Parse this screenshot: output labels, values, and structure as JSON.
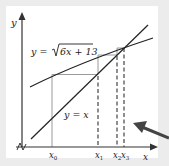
{
  "diagram": {
    "axes": {
      "x_label": "x",
      "y_label": "y"
    },
    "curves": {
      "curve_label": "y = √(6x + 13)",
      "curve_prefix": "y = ",
      "curve_radicand": "6x + 13",
      "line_label": "y = x"
    },
    "x_ticks": [
      {
        "base": "x",
        "sub": "0"
      },
      {
        "base": "x",
        "sub": "1"
      },
      {
        "base": "x",
        "sub": "2"
      },
      {
        "base": "x",
        "sub": "3"
      }
    ],
    "colors": {
      "axis": "#333333",
      "curve": "#222222",
      "cobweb": "#9a9a9a",
      "dashed": "#333333",
      "arrow": "#444444",
      "background": "#ececec",
      "panel": "#ffffff"
    },
    "annotation_arrow": "pointer-arrow"
  }
}
